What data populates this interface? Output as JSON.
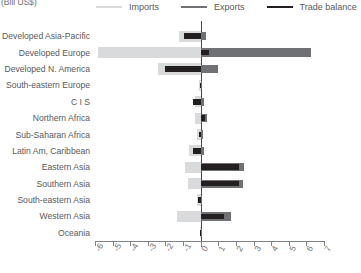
{
  "unit_label": "(Bill US$)",
  "legend": [
    {
      "name": "imports",
      "label": "Imports",
      "color": "#d9dadb"
    },
    {
      "name": "exports",
      "label": "Exports",
      "color": "#6f7175"
    },
    {
      "name": "trade-balance",
      "label": "Trade balance",
      "color": "#231f20"
    }
  ],
  "colors": {
    "imports": "#d9dadb",
    "exports": "#6f7175",
    "balance": "#231f20",
    "axis": "#808285",
    "zero_line": "#4a4a4a",
    "text": "#58595b"
  },
  "chart_data": {
    "type": "bar",
    "orientation": "horizontal",
    "title": "",
    "subtitle": "",
    "xlabel": "(Bill US$)",
    "ylabel": "",
    "xlim": [
      -6,
      7
    ],
    "xticks": [
      "-6",
      "-5",
      "-4",
      "-3",
      "-2",
      "-1",
      "0",
      "1",
      "2",
      "3",
      "4",
      "5",
      "6",
      "7"
    ],
    "grid": false,
    "legend_position": "top",
    "categories": [
      "Developed Asia-Pacific",
      "Developed Europe",
      "Developed N. America",
      "South-eastern Europe",
      "C I S",
      "Northern Africa",
      "Sub-Saharan Africa",
      "Latin Am, Caribbean",
      "Eastern Asia",
      "Southern Asia",
      "South-eastern Asia",
      "Western Asia",
      "Oceania"
    ],
    "series": [
      {
        "name": "Imports",
        "color": "#d9dadb",
        "values": [
          -1.25,
          -5.85,
          -2.45,
          -0.1,
          -0.35,
          -0.3,
          -0.2,
          -0.65,
          -0.9,
          -0.7,
          -0.2,
          -1.35,
          -0.05
        ]
      },
      {
        "name": "Exports",
        "color": "#6f7175",
        "values": [
          0.3,
          6.25,
          1.0,
          0.05,
          0.2,
          0.35,
          0.15,
          0.2,
          2.45,
          2.4,
          0.1,
          1.7,
          0.03
        ]
      },
      {
        "name": "Trade balance",
        "color": "#231f20",
        "values": [
          -0.95,
          0.45,
          -2.05,
          -0.05,
          -0.45,
          0.25,
          -0.1,
          -0.45,
          2.2,
          2.15,
          -0.15,
          1.35,
          -0.02
        ]
      }
    ]
  }
}
